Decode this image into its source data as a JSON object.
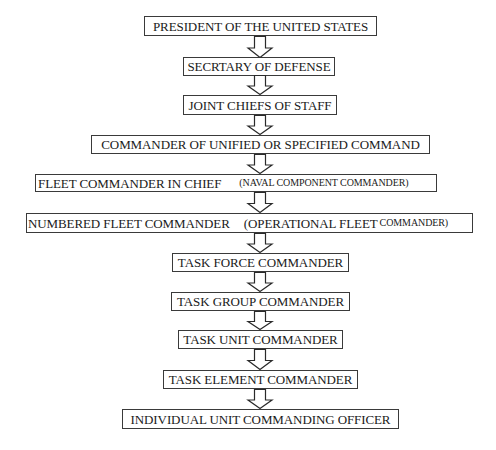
{
  "diagram": {
    "nodes": [
      {
        "id": "n1",
        "label": "PRESIDENT OF THE UNITED STATES"
      },
      {
        "id": "n2",
        "label": "SECRTARY OF DEFENSE"
      },
      {
        "id": "n3",
        "label": "JOINT CHIEFS OF STAFF"
      },
      {
        "id": "n4",
        "label": "COMMANDER OF UNIFIED OR SPECIFIED COMMAND"
      },
      {
        "id": "n5",
        "label": "FLEET COMMANDER IN CHIEF",
        "note": "(NAVAL COMPONENT COMMANDER)"
      },
      {
        "id": "n6",
        "label": "NUMBERED FLEET COMMANDER",
        "note_main": "(OPERATIONAL FLEET",
        "note": "COMMANDER)"
      },
      {
        "id": "n7",
        "label": "TASK FORCE COMMANDER"
      },
      {
        "id": "n8",
        "label": "TASK GROUP COMMANDER"
      },
      {
        "id": "n9",
        "label": "TASK UNIT COMMANDER"
      },
      {
        "id": "n10",
        "label": "TASK ELEMENT COMMANDER"
      },
      {
        "id": "n11",
        "label": "INDIVIDUAL UNIT COMMANDING OFFICER"
      }
    ],
    "edges": [
      {
        "from": "n1",
        "to": "n2",
        "type": "down-arrow"
      },
      {
        "from": "n2",
        "to": "n3",
        "type": "down-arrow"
      },
      {
        "from": "n3",
        "to": "n4",
        "type": "down-arrow"
      },
      {
        "from": "n4",
        "to": "n5",
        "type": "down-arrow"
      },
      {
        "from": "n5",
        "to": "n6",
        "type": "down-arrow"
      },
      {
        "from": "n6",
        "to": "n7",
        "type": "down-arrow"
      },
      {
        "from": "n7",
        "to": "n8",
        "type": "down-arrow"
      },
      {
        "from": "n8",
        "to": "n9",
        "type": "down-arrow"
      },
      {
        "from": "n9",
        "to": "n10",
        "type": "down-arrow"
      },
      {
        "from": "n10",
        "to": "n11",
        "type": "down-arrow"
      }
    ],
    "colors": {
      "border": "#3a3a3a",
      "text": "#1a1a1a",
      "background": "#ffffff"
    }
  }
}
